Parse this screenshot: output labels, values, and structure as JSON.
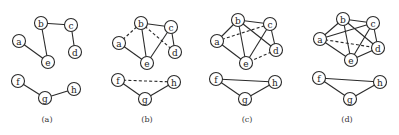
{
  "figure": {
    "panels": [
      {
        "id": "a",
        "caption": "(a)",
        "offset_x": 0,
        "nodes": {
          "a": [
            19,
            41
          ],
          "b": [
            41,
            23
          ],
          "c": [
            71,
            25
          ],
          "d": [
            75,
            52
          ],
          "e": [
            48,
            62
          ],
          "f": [
            18,
            81
          ],
          "g": [
            45,
            98
          ],
          "h": [
            74,
            89
          ]
        },
        "edges": [
          {
            "from": "b",
            "to": "c",
            "style": "solid"
          },
          {
            "from": "c",
            "to": "d",
            "style": "solid"
          },
          {
            "from": "b",
            "to": "e",
            "style": "solid"
          },
          {
            "from": "a",
            "to": "e",
            "style": "solid"
          },
          {
            "from": "f",
            "to": "g",
            "style": "solid"
          },
          {
            "from": "g",
            "to": "h",
            "style": "solid"
          }
        ]
      },
      {
        "id": "b",
        "caption": "(b)",
        "offset_x": 100,
        "nodes": {
          "a": [
            19,
            43
          ],
          "b": [
            41,
            23
          ],
          "c": [
            71,
            27
          ],
          "d": [
            75,
            52
          ],
          "e": [
            47,
            63
          ],
          "f": [
            18,
            80
          ],
          "g": [
            45,
            99
          ],
          "h": [
            74,
            82
          ]
        },
        "edges": [
          {
            "from": "b",
            "to": "c",
            "style": "solid"
          },
          {
            "from": "c",
            "to": "d",
            "style": "solid"
          },
          {
            "from": "b",
            "to": "e",
            "style": "solid"
          },
          {
            "from": "a",
            "to": "e",
            "style": "solid"
          },
          {
            "from": "c",
            "to": "e",
            "style": "solid"
          },
          {
            "from": "a",
            "to": "b",
            "style": "dashed"
          },
          {
            "from": "b",
            "to": "d",
            "style": "dashed"
          },
          {
            "from": "f",
            "to": "g",
            "style": "solid"
          },
          {
            "from": "g",
            "to": "h",
            "style": "solid"
          },
          {
            "from": "f",
            "to": "h",
            "style": "dashed"
          }
        ]
      },
      {
        "id": "c",
        "caption": "(c)",
        "offset_x": 200,
        "nodes": {
          "a": [
            17,
            41
          ],
          "b": [
            38,
            20
          ],
          "c": [
            70,
            24
          ],
          "d": [
            76,
            50
          ],
          "e": [
            46,
            63
          ],
          "f": [
            16,
            79
          ],
          "g": [
            45,
            99
          ],
          "h": [
            75,
            82
          ]
        },
        "edges": [
          {
            "from": "a",
            "to": "b",
            "style": "solid"
          },
          {
            "from": "b",
            "to": "c",
            "style": "solid"
          },
          {
            "from": "c",
            "to": "d",
            "style": "solid"
          },
          {
            "from": "b",
            "to": "d",
            "style": "solid"
          },
          {
            "from": "b",
            "to": "e",
            "style": "solid"
          },
          {
            "from": "a",
            "to": "e",
            "style": "solid"
          },
          {
            "from": "c",
            "to": "e",
            "style": "solid"
          },
          {
            "from": "a",
            "to": "c",
            "style": "dashed"
          },
          {
            "from": "d",
            "to": "e",
            "style": "dashed"
          },
          {
            "from": "f",
            "to": "g",
            "style": "solid"
          },
          {
            "from": "g",
            "to": "h",
            "style": "solid"
          },
          {
            "from": "f",
            "to": "h",
            "style": "solid"
          }
        ]
      },
      {
        "id": "d",
        "caption": "(d)",
        "offset_x": 300,
        "nodes": {
          "a": [
            20,
            39
          ],
          "b": [
            43,
            19
          ],
          "c": [
            73,
            23
          ],
          "d": [
            78,
            48
          ],
          "e": [
            51,
            60
          ],
          "f": [
            19,
            78
          ],
          "g": [
            50,
            99
          ],
          "h": [
            80,
            82
          ]
        },
        "edges": [
          {
            "from": "a",
            "to": "b",
            "style": "solid"
          },
          {
            "from": "b",
            "to": "c",
            "style": "solid"
          },
          {
            "from": "c",
            "to": "d",
            "style": "solid"
          },
          {
            "from": "b",
            "to": "d",
            "style": "solid"
          },
          {
            "from": "b",
            "to": "e",
            "style": "solid"
          },
          {
            "from": "a",
            "to": "e",
            "style": "solid"
          },
          {
            "from": "c",
            "to": "e",
            "style": "solid"
          },
          {
            "from": "a",
            "to": "c",
            "style": "solid"
          },
          {
            "from": "d",
            "to": "e",
            "style": "solid"
          },
          {
            "from": "a",
            "to": "d",
            "style": "dashed"
          },
          {
            "from": "f",
            "to": "g",
            "style": "solid"
          },
          {
            "from": "g",
            "to": "h",
            "style": "solid"
          },
          {
            "from": "f",
            "to": "h",
            "style": "solid"
          }
        ]
      }
    ],
    "node_radius": 6.5,
    "caption_y": 122,
    "colors": {
      "stroke": "#2a2a2a",
      "fill": "#ffffff",
      "text": "#222222"
    }
  }
}
